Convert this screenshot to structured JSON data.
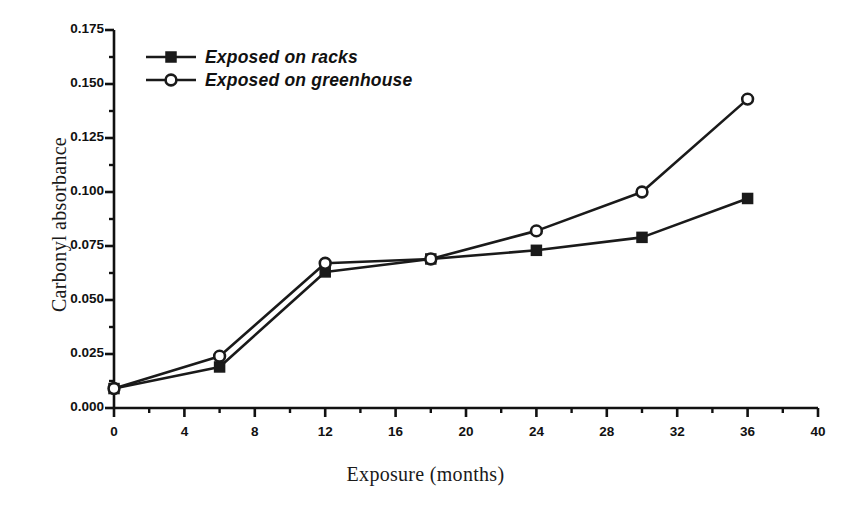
{
  "chart_data": {
    "type": "line",
    "title": "",
    "xlabel": "Exposure (months)",
    "ylabel": "Carbonyl absorbance",
    "xlim": [
      0,
      40
    ],
    "ylim": [
      0.0,
      0.175
    ],
    "xticks": [
      0,
      4,
      8,
      12,
      16,
      20,
      24,
      28,
      32,
      36,
      40
    ],
    "xtick_labels": [
      "0",
      "4",
      "8",
      "12",
      "16",
      "20",
      "24",
      "28",
      "32",
      "36",
      "40"
    ],
    "xminor_step": 2,
    "yticks": [
      0.0,
      0.025,
      0.05,
      0.075,
      0.1,
      0.125,
      0.15,
      0.175
    ],
    "ytick_labels": [
      "0.000",
      "0.025",
      "0.050",
      "0.075",
      "0.100",
      "0.125",
      "0.150",
      "0.175"
    ],
    "yminor_step": 0.0125,
    "grid": false,
    "legend_position": "top-left",
    "x": [
      0,
      6,
      12,
      18,
      24,
      30,
      36
    ],
    "series": [
      {
        "name": "Exposed on racks",
        "marker": "filled-square",
        "color": "#1a1a1a",
        "values": [
          0.009,
          0.019,
          0.063,
          0.069,
          0.073,
          0.079,
          0.097
        ]
      },
      {
        "name": "Exposed on greenhouse",
        "marker": "open-circle",
        "color": "#1a1a1a",
        "values": [
          0.009,
          0.024,
          0.067,
          0.069,
          0.082,
          0.1,
          0.143
        ]
      }
    ]
  },
  "legend": {
    "entries": [
      {
        "label": "Exposed on racks"
      },
      {
        "label": "Exposed on greenhouse"
      }
    ]
  },
  "axes": {
    "x_title": "Exposure (months)",
    "y_title": "Carbonyl absorbance"
  }
}
